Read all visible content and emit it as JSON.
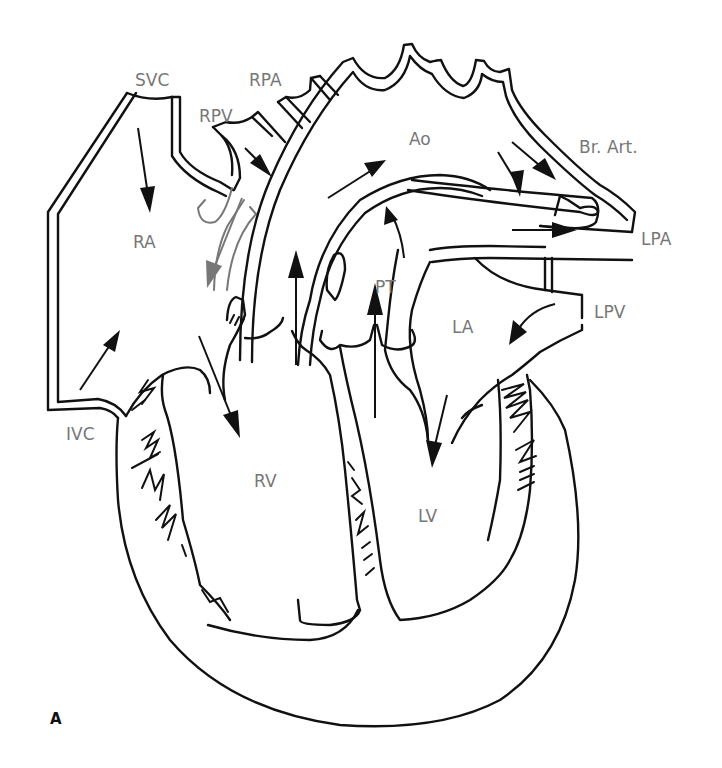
{
  "figure": {
    "panel_label": "A",
    "labels": {
      "svc": "SVC",
      "rpa": "RPA",
      "rpv": "RPV",
      "ao": "Ao",
      "br_art": "Br. Art.",
      "lpa": "LPA",
      "ra": "RA",
      "pt": "PT",
      "lpv": "LPV",
      "la": "LA",
      "ivc": "IVC",
      "rv": "RV",
      "lv": "LV"
    },
    "colors": {
      "outline": "#111111",
      "label": "#777777",
      "highlight_flow": "#777777",
      "background": "#ffffff"
    }
  }
}
